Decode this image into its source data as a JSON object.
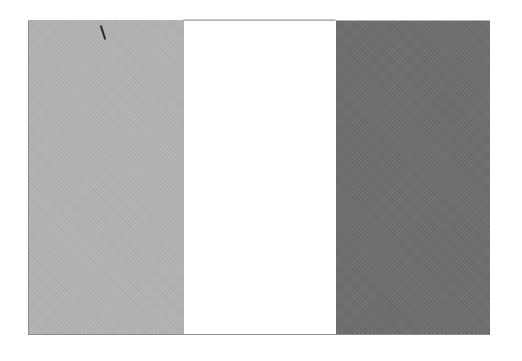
{
  "image": {
    "description": "Scanned grayscale tricolor flag with three vertical bands",
    "bands": [
      {
        "position": "left",
        "shade": "#b3b3b3"
      },
      {
        "position": "middle",
        "shade": "#ffffff"
      },
      {
        "position": "right",
        "shade": "#6f6f6f"
      }
    ],
    "artifact": "small dark scratch mark near top of left band"
  }
}
